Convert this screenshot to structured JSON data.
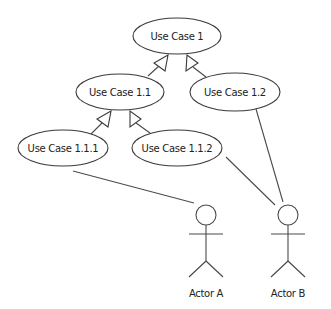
{
  "diagram": {
    "type": "uml-use-case",
    "use_cases": [
      {
        "id": "uc1",
        "label": "Use Case 1",
        "cx": 177,
        "cy": 36,
        "rx": 44,
        "ry": 18
      },
      {
        "id": "uc11",
        "label": "Use Case 1.1",
        "cx": 120,
        "cy": 92,
        "rx": 44,
        "ry": 18
      },
      {
        "id": "uc12",
        "label": "Use Case 1.2",
        "cx": 235,
        "cy": 92,
        "rx": 45,
        "ry": 19
      },
      {
        "id": "uc111",
        "label": "Use Case 1.1.1",
        "cx": 63,
        "cy": 148,
        "rx": 45,
        "ry": 18
      },
      {
        "id": "uc112",
        "label": "Use Case 1.1.2",
        "cx": 177,
        "cy": 148,
        "rx": 45,
        "ry": 18
      }
    ],
    "actors": [
      {
        "id": "actorA",
        "label": "Actor A",
        "x": 206
      },
      {
        "id": "actorB",
        "label": "Actor B",
        "x": 288
      }
    ],
    "generalizations": [
      {
        "from": "Use Case 1.1",
        "to": "Use Case 1"
      },
      {
        "from": "Use Case 1.2",
        "to": "Use Case 1"
      },
      {
        "from": "Use Case 1.1.1",
        "to": "Use Case 1.1"
      },
      {
        "from": "Use Case 1.1.2",
        "to": "Use Case 1.1"
      }
    ],
    "associations": [
      {
        "from": "Use Case 1.1.1",
        "to": "Actor A"
      },
      {
        "from": "Use Case 1.1.2",
        "to": "Actor B"
      },
      {
        "from": "Use Case 1.2",
        "to": "Actor B"
      }
    ],
    "colors": {
      "stroke": "#3a3a3a",
      "fill": "#ffffff",
      "text": "#222222"
    }
  }
}
